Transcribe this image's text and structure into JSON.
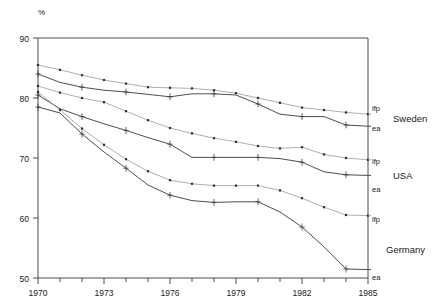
{
  "chart_data": {
    "type": "line",
    "title": "",
    "xlabel": "",
    "ylabel": "%",
    "ylim": [
      50,
      90
    ],
    "xlim": [
      1970,
      1985
    ],
    "grid": false,
    "legend_position": "right-of-plot",
    "y_ticks": [
      50,
      60,
      70,
      80,
      90
    ],
    "x_ticks": [
      1970,
      1973,
      1976,
      1979,
      1982,
      1985
    ],
    "x_minor_ticks": [
      1971,
      1972,
      1974,
      1975,
      1977,
      1978,
      1980,
      1981,
      1983,
      1984
    ],
    "x": [
      1970,
      1971,
      1972,
      1973,
      1974,
      1975,
      1976,
      1977,
      1978,
      1979,
      1980,
      1981,
      1982,
      1983,
      1984,
      1985
    ],
    "series": [
      {
        "name": "Sweden lfp",
        "country": "Sweden",
        "measure": "lfp",
        "marker": "square",
        "values": [
          85.5,
          84.7,
          83.8,
          83.0,
          82.4,
          81.8,
          81.7,
          81.6,
          81.3,
          80.8,
          80.0,
          79.2,
          78.4,
          78.0,
          77.6,
          77.3
        ]
      },
      {
        "name": "Sweden ea",
        "country": "Sweden",
        "measure": "ea",
        "marker": "plus",
        "values": [
          84.0,
          82.6,
          81.8,
          81.3,
          81.0,
          80.6,
          80.2,
          80.7,
          80.7,
          80.5,
          79.0,
          77.3,
          76.9,
          76.9,
          75.5,
          75.3
        ]
      },
      {
        "name": "USA lfp",
        "country": "USA",
        "measure": "lfp",
        "marker": "square",
        "values": [
          82.0,
          80.9,
          80.0,
          79.3,
          77.8,
          76.3,
          75.0,
          74.1,
          73.3,
          72.7,
          72.0,
          71.6,
          71.8,
          70.6,
          70.0,
          69.7
        ]
      },
      {
        "name": "USA ea",
        "country": "USA",
        "measure": "ea",
        "marker": "plus",
        "values": [
          80.5,
          78.2,
          76.9,
          75.7,
          74.6,
          73.4,
          72.3,
          70.1,
          70.1,
          70.1,
          70.1,
          69.9,
          69.3,
          67.7,
          67.2,
          67.1
        ]
      },
      {
        "name": "Germany lfp",
        "country": "Germany",
        "measure": "lfp",
        "marker": "square",
        "values": [
          81.0,
          78.0,
          74.9,
          72.2,
          69.8,
          67.8,
          66.3,
          65.7,
          65.4,
          65.4,
          65.4,
          64.6,
          63.3,
          61.8,
          60.5,
          60.4
        ]
      },
      {
        "name": "Germany ea",
        "country": "Germany",
        "measure": "ea",
        "marker": "plus",
        "values": [
          78.5,
          77.5,
          74.0,
          71.0,
          68.3,
          65.5,
          63.8,
          62.9,
          62.6,
          62.7,
          62.7,
          61.0,
          58.5,
          55.2,
          51.5,
          51.4
        ]
      }
    ],
    "annotations": [
      {
        "text": "lfp",
        "country": "Sweden"
      },
      {
        "text": "ea",
        "country": "Sweden"
      },
      {
        "text": "Sweden",
        "country": "Sweden"
      },
      {
        "text": "lfp",
        "country": "USA"
      },
      {
        "text": "ea",
        "country": "USA"
      },
      {
        "text": "USA",
        "country": "USA"
      },
      {
        "text": "lfp",
        "country": "Germany"
      },
      {
        "text": "ea",
        "country": "Germany"
      },
      {
        "text": "Germany",
        "country": "Germany"
      }
    ]
  },
  "axes": {
    "y_unit_label": "%",
    "y_tick_labels": [
      "90",
      "80",
      "70",
      "60",
      "50"
    ],
    "x_tick_labels": [
      "1970",
      "1973",
      "1976",
      "1979",
      "1982",
      "1985"
    ]
  },
  "labels": {
    "sweden_lfp": "lfp",
    "sweden_ea": "ea",
    "sweden_country": "Sweden",
    "usa_lfp": "lfp",
    "usa_ea": "ea",
    "usa_country": "USA",
    "germany_lfp": "lfp",
    "germany_ea": "ea",
    "germany_country": "Germany"
  },
  "colors": {
    "line_dark": "#3a3a3a",
    "line_light": "#9a9a9a",
    "axis": "#3a3a3a",
    "text": "#1a1a1a",
    "background": "#ffffff"
  }
}
